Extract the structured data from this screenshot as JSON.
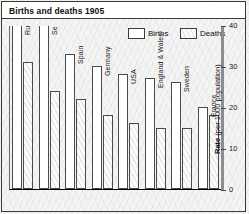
{
  "title": "Births and deaths 1905",
  "legend": [
    {
      "label": "Births",
      "swatch": "white-box-icon"
    },
    {
      "label": "Deaths",
      "swatch": "hatched-box-icon"
    }
  ],
  "yaxis": {
    "title_bold": "Rate",
    "title_rest": " (per 1000 population)",
    "ticks": [
      "0",
      "10",
      "20",
      "30",
      "40"
    ]
  },
  "chart_data": {
    "type": "bar",
    "title": "Births and deaths 1905",
    "xlabel": "",
    "ylabel": "Rate (per 1000 population)",
    "ylim": [
      0,
      40
    ],
    "grid": false,
    "legend_position": "top-right",
    "categories": [
      "Russia",
      "Serbia",
      "Spain",
      "Germany",
      "USA",
      "England & Wales",
      "Sweden",
      "France"
    ],
    "series": [
      {
        "name": "Births",
        "values": [
          48,
          42,
          33,
          30,
          28,
          27,
          26,
          20
        ]
      },
      {
        "name": "Deaths",
        "values": [
          31,
          24,
          22,
          18,
          16,
          15,
          15,
          18
        ]
      }
    ]
  }
}
